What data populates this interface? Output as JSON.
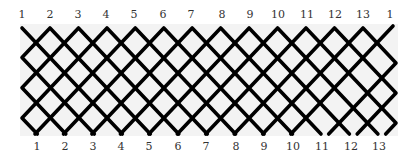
{
  "diagram": {
    "type": "braid-lattice",
    "colors": {
      "strand": "#000000",
      "panel_background": "#f3f3f3",
      "label": "#333333",
      "page_background": "#ffffff"
    },
    "top_labels": [
      "1",
      "2",
      "3",
      "4",
      "5",
      "6",
      "7",
      "8",
      "9",
      "10",
      "11",
      "12",
      "13",
      "1"
    ],
    "bottom_labels": [
      "1",
      "2",
      "3",
      "4",
      "5",
      "6",
      "7",
      "8",
      "9",
      "10",
      "11",
      "12",
      "13"
    ],
    "top_label_x": [
      22,
      50,
      78,
      106,
      134,
      163,
      191,
      222,
      250,
      278,
      307,
      335,
      363,
      390
    ],
    "bottom_label_x": [
      37,
      65,
      93,
      121,
      149,
      178,
      206,
      236,
      264,
      293,
      322,
      351,
      379
    ],
    "top_label_y": 18,
    "bottom_label_y": 150,
    "lattice": {
      "left_x": 22,
      "right_x": 396,
      "top_y": 28,
      "bottom_y": 134,
      "slope_dx_per_dy": 0.946,
      "top_peaks_x": [
        50,
        78.5,
        107,
        135.3,
        163.8,
        192.2,
        220.7,
        249.1,
        277.6,
        306,
        334.5,
        363
      ],
      "open_ends": [
        {
          "x": 22,
          "y": 28,
          "dir": 1
        },
        {
          "x": 393,
          "y": 26,
          "dir": -1
        }
      ],
      "stroke_width": 3.6
    }
  }
}
